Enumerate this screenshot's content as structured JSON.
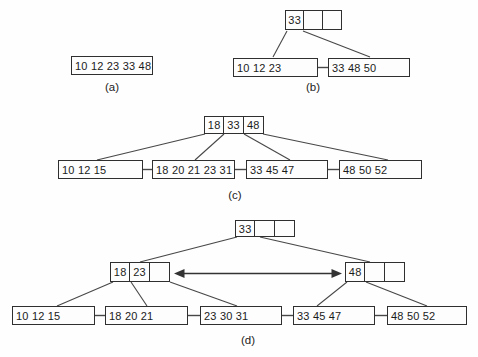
{
  "colors": {
    "background": "#fefefe",
    "box_border": "#2f2f2f",
    "line": "#474747",
    "text": "#1b1b1b"
  },
  "panels": {
    "a": {
      "label": "(a)",
      "leaves": [
        "10 12 23 33 48"
      ]
    },
    "b": {
      "label": "(b)",
      "root": [
        "33",
        "",
        ""
      ],
      "leaves": [
        "10 12 23",
        "33 48 50"
      ]
    },
    "c": {
      "label": "(c)",
      "root": [
        "18",
        "33",
        "48"
      ],
      "leaves": [
        "10 12 15",
        "18 20 21 23 31",
        "33 45 47",
        "48 50 52"
      ]
    },
    "d": {
      "label": "(d)",
      "root": [
        "33",
        "",
        ""
      ],
      "internal": [
        [
          "18",
          "23",
          ""
        ],
        [
          "48",
          "",
          ""
        ]
      ],
      "leaves": [
        "10 12 15",
        "18 20 21",
        "23 30 31",
        "33 45 47",
        "48 50 52"
      ]
    }
  }
}
